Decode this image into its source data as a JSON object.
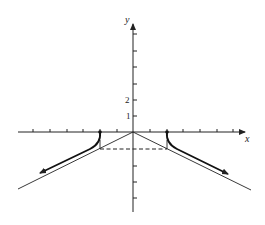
{
  "figure": {
    "type": "function-graph",
    "axes": {
      "x_label": "x",
      "y_label": "y",
      "y_tick_labels": [
        {
          "value": 1,
          "text": "1"
        },
        {
          "value": 2,
          "text": "2"
        }
      ],
      "x_ticks": [
        -6,
        -5,
        -4,
        -3,
        -2,
        -1,
        1,
        2,
        3,
        4,
        5,
        6
      ],
      "y_ticks": [
        -5,
        -4,
        -3,
        -1,
        1,
        2,
        3,
        4,
        5,
        6
      ]
    },
    "curves": [
      {
        "name": "left-branch",
        "start": [
          -2,
          0
        ],
        "direction": "down-left",
        "arrow": true,
        "closed_endpoint": true
      },
      {
        "name": "right-branch",
        "start": [
          2,
          0
        ],
        "direction": "down-right",
        "arrow": true,
        "closed_endpoint": true
      }
    ],
    "asymptotes": [
      {
        "name": "left-asymptote",
        "from": [
          0,
          0
        ],
        "slope": 0.5
      },
      {
        "name": "right-asymptote",
        "from": [
          0,
          0
        ],
        "slope": -0.5
      }
    ],
    "guides": [
      {
        "name": "dashed-horizontal",
        "y": -1,
        "x_range": [
          -2,
          2
        ],
        "style": "dashed"
      },
      {
        "name": "left-vertical-guide",
        "x": -2,
        "y_range": [
          -1,
          0
        ]
      },
      {
        "name": "right-vertical-guide",
        "x": 2,
        "y_range": [
          -1,
          0
        ]
      }
    ],
    "colors": {
      "ink": "#222222",
      "background": "#ffffff"
    }
  }
}
